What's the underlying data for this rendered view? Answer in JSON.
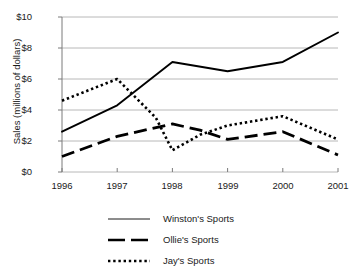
{
  "chart_data": {
    "type": "line",
    "title": "",
    "subtitle": "",
    "xlabel": "",
    "ylabel": "Sales (millions of dollars)",
    "x": [
      1996,
      1997,
      1998,
      1999,
      2000,
      2001
    ],
    "categories": [
      "1996",
      "1997",
      "1998",
      "1999",
      "2000",
      "2001"
    ],
    "xlim": [
      1996,
      2001
    ],
    "ylim": [
      0,
      10
    ],
    "yticks": [
      0,
      2,
      4,
      6,
      8,
      10
    ],
    "ytick_labels": [
      "$0",
      "$2",
      "$4",
      "$6",
      "$8",
      "$10"
    ],
    "xtick_labels": [
      "1996",
      "1997",
      "1998",
      "1999",
      "2000",
      "2001"
    ],
    "grid": "horizontal",
    "legend_position": "bottom",
    "series": [
      {
        "name": "Winston's Sports",
        "style": "solid",
        "color": "#000000",
        "values": [
          2.6,
          4.3,
          7.1,
          6.5,
          7.1,
          9.0
        ]
      },
      {
        "name": "Ollie's Sports",
        "style": "dashed",
        "color": "#000000",
        "values": [
          1.0,
          2.3,
          3.1,
          2.1,
          2.6,
          1.1
        ]
      },
      {
        "name": "Jay's Sports",
        "style": "dotted",
        "color": "#000000",
        "values": [
          4.6,
          6.0,
          1.4,
          3.0,
          3.6,
          2.1
        ]
      }
    ],
    "annotations": {
      "jays_mid_1997_1998_dip_x": 1997.7,
      "jays_mid_1997_1998_dip_y": 3.5,
      "jays_mid_1998_1999_x": 1998.5,
      "jays_mid_1998_1999_y": 2.4,
      "ollies_mid_1998_1999_x": 1998.5,
      "ollies_mid_1998_1999_y": 2.7
    }
  },
  "legend": {
    "items": [
      {
        "label": "Winston's Sports",
        "swatch": "thin-solid-line-swatch"
      },
      {
        "label": "Ollie's Sports",
        "swatch": "thick-dashed-line-swatch"
      },
      {
        "label": "Jay's Sports",
        "swatch": "dotted-line-swatch"
      }
    ]
  },
  "axes": {
    "y_title": "Sales (millions of dollars)",
    "y_labels": [
      "$10",
      "$8",
      "$6",
      "$4",
      "$2",
      "$0"
    ],
    "x_labels": [
      "1996",
      "1997",
      "1998",
      "1999",
      "2000",
      "2001"
    ]
  },
  "colors": {
    "ink": "#000000",
    "gridline": "#b8b8b8",
    "axis": "#7a7a7a",
    "background": "#ffffff"
  }
}
